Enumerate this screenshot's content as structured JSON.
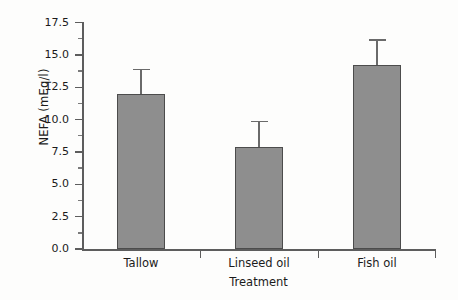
{
  "chart_data": {
    "type": "bar",
    "title": "",
    "xlabel": "Treatment",
    "ylabel": "NEFA (mEq/l)",
    "categories": [
      "Tallow",
      "Linseed oil",
      "Fish oil"
    ],
    "values": [
      12.0,
      7.9,
      14.2
    ],
    "errors_upper": [
      1.9,
      2.0,
      2.0
    ],
    "error_tops": [
      13.9,
      9.9,
      16.2
    ],
    "ylim": [
      0.0,
      17.5
    ],
    "yticks": [
      "0.0",
      "2.5",
      "5.0",
      "7.5",
      "10.0",
      "12.5",
      "15.0",
      "17.5"
    ],
    "ytick_values": [
      0.0,
      2.5,
      5.0,
      7.5,
      10.0,
      12.5,
      15.0,
      17.5
    ],
    "minor_ticks": [
      1.25,
      3.75,
      6.25,
      8.75,
      11.25,
      13.75,
      16.25
    ],
    "grid": false,
    "legend": null,
    "legend_position": "none",
    "series": [
      {
        "name": "NEFA",
        "values": [
          12.0,
          7.9,
          14.2
        ],
        "error_upper": [
          1.9,
          2.0,
          2.0
        ]
      }
    ],
    "bar_fill_color": "#8e8e8e",
    "bar_edge_color": "#4c4c4c",
    "axis_color": "#5d5d5d",
    "background_color": "#fdfdfc"
  }
}
